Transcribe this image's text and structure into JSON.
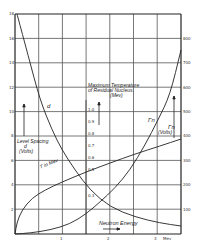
{
  "chart_data": {
    "type": "line",
    "title": "",
    "xlabel": "Neutron Energy",
    "x_unit": "Mev",
    "xlim": [
      0,
      3.5
    ],
    "x_ticks": [
      "1",
      "2",
      "3"
    ],
    "x_tick_values": [
      1,
      2,
      3
    ],
    "left_axis": {
      "label": "Level Spacing d (Volts)",
      "ticks": [
        "2",
        "4",
        "6",
        "8",
        "10",
        "12",
        "14",
        "16",
        "18"
      ],
      "ylim": [
        0,
        18
      ]
    },
    "middle_axis": {
      "label": "Maximum Temperature of Residual Nucleus (Mev)",
      "ticks": [
        "0.3",
        "0.5",
        "0.6",
        "0.7",
        "0.8",
        "0.9",
        "1.0"
      ]
    },
    "right_axis": {
      "label": "Γn (Volts)",
      "ticks": [
        "100",
        "200",
        "300",
        "400",
        "500",
        "600",
        "700",
        "800"
      ],
      "ylim": [
        0,
        900
      ]
    },
    "series": [
      {
        "name": "d",
        "axis": "left",
        "x": [
          0.05,
          0.5,
          1.0,
          1.5,
          2.0,
          2.5,
          3.0,
          3.5
        ],
        "y": [
          18.0,
          11.0,
          7.0,
          4.2,
          2.0,
          1.3,
          0.9,
          0.7
        ]
      },
      {
        "name": "T in Mev",
        "axis": "left",
        "x": [
          0.0,
          0.1,
          0.5,
          1.0,
          1.5,
          2.0,
          2.5,
          3.0,
          3.5
        ],
        "y": [
          0.0,
          1.5,
          3.2,
          4.3,
          5.0,
          5.7,
          6.3,
          6.9,
          7.6
        ]
      },
      {
        "name": "Γn",
        "axis": "right",
        "x": [
          0.0,
          0.5,
          1.0,
          1.5,
          2.0,
          2.5,
          3.0,
          3.25,
          3.5
        ],
        "y": [
          0,
          10,
          40,
          120,
          220,
          330,
          480,
          620,
          780
        ]
      }
    ],
    "annotations": [
      "d",
      "T in Mev",
      "Γn",
      "Γn (Volts)",
      "Level Spacing d (Volts)",
      "Maximum Temperature of Residual Nucleus (Mev)",
      "Neutron Energy"
    ],
    "grid": true,
    "legend": "none"
  },
  "labels": {
    "level_spacing_1": "Level Spacing",
    "level_spacing_2": "d",
    "level_spacing_3": "(Volts)",
    "max_temp_1": "Maximum Temperature",
    "max_temp_2": "of Residual Nucleus.",
    "max_temp_3": "(Mev)",
    "gamma_n_curve": "Γn",
    "gamma_n_axis": "Γn",
    "gamma_n_unit": "(Volts)",
    "d_curve": "d",
    "t_curve": "T in Mev",
    "neutron_energy": "Neutron Energy",
    "x_unit": "Mev"
  }
}
